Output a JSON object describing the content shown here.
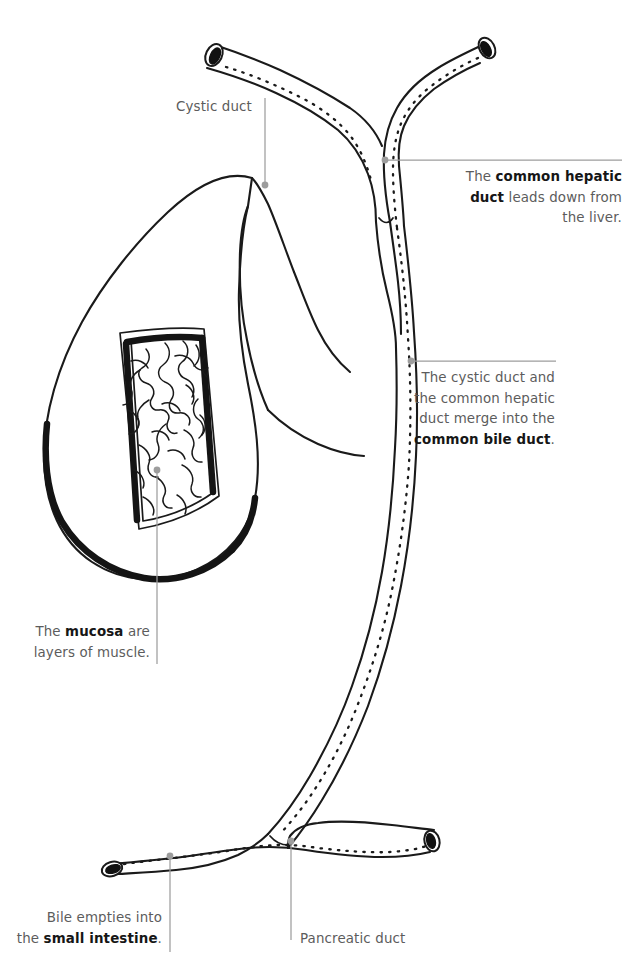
{
  "figure": {
    "background_color": "#ffffff",
    "ink_color": "#1a1a1a",
    "leader_color": "#9a9a9a",
    "text_color": "#5c5c5c",
    "bold_text_color": "#161616"
  },
  "annotations": {
    "cystic_duct": {
      "text": "Cystic duct",
      "align": "right"
    },
    "common_hepatic_duct": {
      "line1_pre": "The ",
      "line1_bold": "common hepatic",
      "line2_bold": "duct",
      "line2_post": " leads down from",
      "line3": "the liver.",
      "align": "right"
    },
    "common_bile_duct": {
      "line1": "The cystic duct and",
      "line2": "the common hepatic",
      "line3": "duct merge into the",
      "line4_bold": "common bile duct",
      "line4_post": ".",
      "align": "right"
    },
    "mucosa": {
      "line1_pre": "The ",
      "line1_bold": "mucosa",
      "line1_post": " are",
      "line2": "layers of muscle.",
      "align": "right"
    },
    "small_intestine": {
      "line1": "Bile empties into",
      "line2_pre": "the ",
      "line2_bold": "small intestine",
      "line2_post": ".",
      "align": "right"
    },
    "pancreatic_duct": {
      "text": "Pancreatic duct",
      "align": "left"
    }
  },
  "labeled_structures": [
    "Cystic duct",
    "Common hepatic duct",
    "Common bile duct",
    "Mucosa",
    "Small intestine",
    "Pancreatic duct"
  ]
}
